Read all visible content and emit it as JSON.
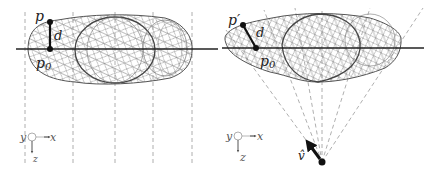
{
  "figure": {
    "panels": [
      {
        "id": "orthographic",
        "labels": {
          "point": "p",
          "base_point": "p",
          "base_sub": "0",
          "distance": "d"
        },
        "axes": {
          "y": "y",
          "x": "x",
          "z": "z"
        }
      },
      {
        "id": "perspective",
        "labels": {
          "point": "p′",
          "base_point": "p",
          "base_sub": "0",
          "distance": "d",
          "view_vector": "v̂"
        },
        "axes": {
          "y": "y",
          "x": "x",
          "z": "z"
        }
      }
    ],
    "colors": {
      "axis": "#222222",
      "mesh": "#7a7a7a",
      "dashed": "#9a9a9a",
      "point": "#111111"
    }
  }
}
